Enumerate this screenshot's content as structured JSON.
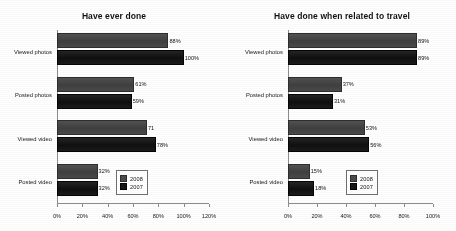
{
  "chart_data": [
    {
      "type": "bar",
      "orientation": "horizontal",
      "title": "Have ever done",
      "xlabel": "",
      "ylabel": "",
      "xlim": [
        0,
        120
      ],
      "xticks": [
        "0%",
        "20%",
        "40%",
        "60%",
        "80%",
        "100%",
        "120%"
      ],
      "xtick_values": [
        0,
        20,
        40,
        60,
        80,
        100,
        120
      ],
      "grid": false,
      "legend_position": "lower-right",
      "categories": [
        "Viewed photos",
        "Posted photos",
        "Viewed video",
        "Posted video"
      ],
      "series": [
        {
          "name": "2008",
          "color": "#4b4b4b",
          "values": [
            88,
            61,
            71,
            32
          ],
          "labels": [
            "88%",
            "61%",
            "71",
            "32%"
          ]
        },
        {
          "name": "2007",
          "color": "#151515",
          "values": [
            100,
            59,
            78,
            32
          ],
          "labels": [
            "100%",
            "59%",
            "78%",
            "32%"
          ]
        }
      ]
    },
    {
      "type": "bar",
      "orientation": "horizontal",
      "title": "Have done when related to travel",
      "xlabel": "",
      "ylabel": "",
      "xlim": [
        0,
        100
      ],
      "xticks": [
        "0%",
        "20%",
        "40%",
        "60%",
        "80%",
        "100%"
      ],
      "xtick_values": [
        0,
        20,
        40,
        60,
        80,
        100
      ],
      "grid": false,
      "legend_position": "lower-right",
      "categories": [
        "Viewed photos",
        "Posted photos",
        "Viewed video",
        "Posted video"
      ],
      "series": [
        {
          "name": "2008",
          "color": "#4b4b4b",
          "values": [
            89,
            37,
            53,
            15
          ],
          "labels": [
            "89%",
            "37%",
            "53%",
            "15%"
          ]
        },
        {
          "name": "2007",
          "color": "#151515",
          "values": [
            89,
            31,
            56,
            18
          ],
          "labels": [
            "89%",
            "31%",
            "56%",
            "18%"
          ]
        }
      ]
    }
  ]
}
